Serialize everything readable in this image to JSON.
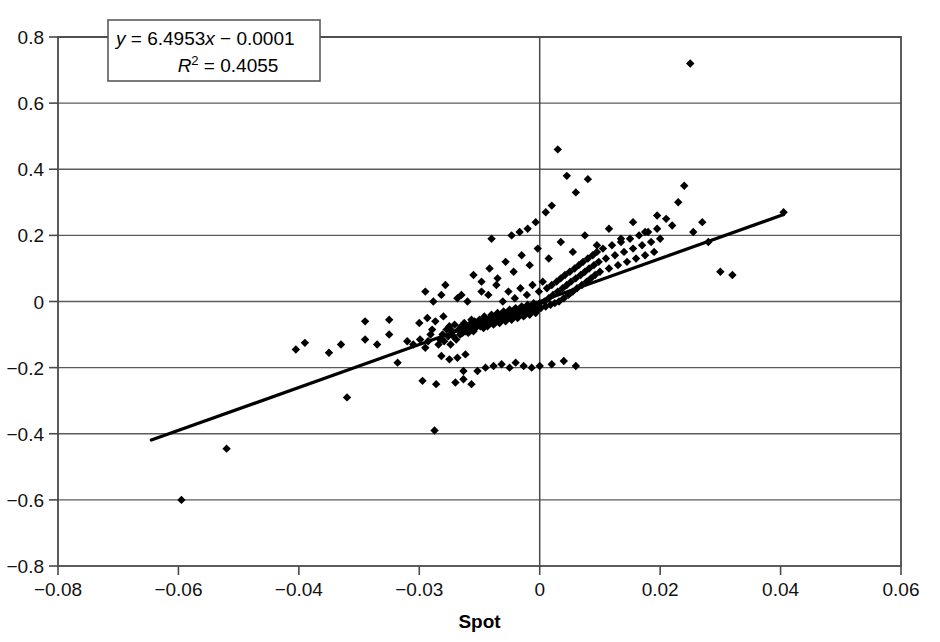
{
  "chart_data": {
    "type": "scatter",
    "title": "",
    "xlabel": "Spot",
    "ylabel": "",
    "xlim": [
      -0.08,
      0.06
    ],
    "ylim": [
      -0.8,
      0.8
    ],
    "grid": true,
    "legend": null,
    "xticks": [
      "-0.08",
      "-0.06",
      "-0.04",
      "-0.03",
      "0",
      "0.02",
      "0.04",
      "0.06"
    ],
    "yticks": [
      "0.8",
      "0.6",
      "0.4",
      "0.2",
      "0",
      "-0.2",
      "-0.4",
      "-0.6",
      "-0.8"
    ],
    "annotations": {
      "equation": "y = 6.4953x − 0.0001",
      "equation_y": "y",
      "equation_rest": " = 6.4953",
      "equation_x": "x",
      "equation_tail": " − 0.0001",
      "r_squared_symbol": "R",
      "r_squared_exponent": "2",
      "r_squared_value": " = 0.4055",
      "r_squared": "R2 = 0.4055"
    },
    "trendline": {
      "slope": 6.4953,
      "intercept": -0.0001,
      "r2": 0.4055,
      "x_start": -0.0645,
      "x_end": 0.0405
    },
    "series": [
      {
        "name": "Spot vs Return",
        "marker": "diamond",
        "color": "#000000",
        "points": [
          [
            -0.0595,
            -0.6
          ],
          [
            -0.052,
            -0.445
          ],
          [
            -0.0405,
            -0.145
          ],
          [
            -0.0395,
            -0.125
          ],
          [
            -0.0375,
            -0.155
          ],
          [
            -0.0365,
            -0.13
          ],
          [
            -0.036,
            -0.29
          ],
          [
            -0.0345,
            -0.115
          ],
          [
            -0.0335,
            -0.13
          ],
          [
            -0.0325,
            -0.1
          ],
          [
            -0.0318,
            -0.185
          ],
          [
            -0.031,
            -0.12
          ],
          [
            -0.0305,
            -0.13
          ],
          [
            -0.0298,
            -0.115
          ],
          [
            -0.0292,
            -0.24
          ],
          [
            -0.0285,
            -0.14
          ],
          [
            -0.0278,
            -0.12
          ],
          [
            -0.0272,
            -0.1
          ],
          [
            -0.0268,
            -0.085
          ],
          [
            -0.0262,
            -0.39
          ],
          [
            -0.0258,
            -0.25
          ],
          [
            -0.0252,
            -0.13
          ],
          [
            -0.0248,
            -0.115
          ],
          [
            -0.0245,
            0.02
          ],
          [
            -0.0242,
            -0.1
          ],
          [
            -0.0238,
            -0.12
          ],
          [
            -0.0232,
            -0.085
          ],
          [
            -0.0228,
            -0.105
          ],
          [
            -0.0225,
            -0.075
          ],
          [
            -0.0222,
            -0.13
          ],
          [
            -0.0218,
            -0.09
          ],
          [
            -0.0215,
            -0.105
          ],
          [
            -0.0212,
            -0.07
          ],
          [
            -0.0208,
            -0.115
          ],
          [
            -0.0205,
            0.01
          ],
          [
            -0.0202,
            -0.085
          ],
          [
            -0.0198,
            -0.1
          ],
          [
            -0.0195,
            -0.075
          ],
          [
            -0.0192,
            -0.095
          ],
          [
            -0.019,
            -0.21
          ],
          [
            -0.0188,
            -0.065
          ],
          [
            -0.0185,
            -0.09
          ],
          [
            -0.0182,
            -0.08
          ],
          [
            -0.018,
            0.0
          ],
          [
            -0.0178,
            -0.095
          ],
          [
            -0.0175,
            -0.07
          ],
          [
            -0.0172,
            -0.085
          ],
          [
            -0.017,
            -0.055
          ],
          [
            -0.0168,
            -0.075
          ],
          [
            -0.0165,
            -0.09
          ],
          [
            -0.0162,
            -0.06
          ],
          [
            -0.016,
            -0.08
          ],
          [
            -0.0158,
            -0.065
          ],
          [
            -0.0155,
            -0.21
          ],
          [
            -0.0152,
            -0.07
          ],
          [
            -0.015,
            -0.055
          ],
          [
            -0.0148,
            -0.075
          ],
          [
            -0.0145,
            0.03
          ],
          [
            -0.0142,
            -0.06
          ],
          [
            -0.014,
            -0.08
          ],
          [
            -0.0138,
            -0.045
          ],
          [
            -0.0135,
            -0.065
          ],
          [
            -0.0132,
            -0.055
          ],
          [
            -0.013,
            -0.075
          ],
          [
            -0.0128,
            0.02
          ],
          [
            -0.0125,
            -0.05
          ],
          [
            -0.0122,
            -0.065
          ],
          [
            -0.012,
            -0.04
          ],
          [
            -0.0118,
            -0.055
          ],
          [
            -0.0115,
            -0.07
          ],
          [
            -0.0112,
            -0.045
          ],
          [
            -0.011,
            -0.06
          ],
          [
            -0.0108,
            0.05
          ],
          [
            -0.0105,
            -0.035
          ],
          [
            -0.0102,
            -0.05
          ],
          [
            -0.01,
            -0.065
          ],
          [
            -0.0098,
            -0.04
          ],
          [
            -0.0095,
            -0.055
          ],
          [
            -0.0092,
            0.0
          ],
          [
            -0.009,
            -0.03
          ],
          [
            -0.0088,
            -0.045
          ],
          [
            -0.0085,
            -0.06
          ],
          [
            -0.0082,
            -0.035
          ],
          [
            -0.008,
            -0.05
          ],
          [
            -0.0078,
            0.03
          ],
          [
            -0.0075,
            -0.025
          ],
          [
            -0.0072,
            -0.04
          ],
          [
            -0.007,
            -0.055
          ],
          [
            -0.0068,
            -0.03
          ],
          [
            -0.0065,
            -0.045
          ],
          [
            -0.0062,
            0.01
          ],
          [
            -0.006,
            -0.02
          ],
          [
            -0.0058,
            -0.035
          ],
          [
            -0.0055,
            -0.05
          ],
          [
            -0.0052,
            -0.025
          ],
          [
            -0.005,
            -0.04
          ],
          [
            -0.0048,
            0.04
          ],
          [
            -0.0045,
            -0.015
          ],
          [
            -0.0042,
            -0.03
          ],
          [
            -0.004,
            -0.045
          ],
          [
            -0.0038,
            -0.02
          ],
          [
            -0.0035,
            -0.035
          ],
          [
            -0.0032,
            0.02
          ],
          [
            -0.003,
            -0.01
          ],
          [
            -0.0028,
            -0.025
          ],
          [
            -0.0025,
            -0.04
          ],
          [
            -0.0022,
            -0.015
          ],
          [
            -0.002,
            -0.03
          ],
          [
            -0.0018,
            0.05
          ],
          [
            -0.0015,
            -0.005
          ],
          [
            -0.0012,
            -0.02
          ],
          [
            -0.001,
            -0.035
          ],
          [
            -0.0008,
            -0.01
          ],
          [
            -0.0005,
            -0.025
          ],
          [
            -0.0002,
            0.03
          ],
          [
            0.0,
            -0.005
          ],
          [
            0.0002,
            -0.02
          ],
          [
            0.0005,
            0.06
          ],
          [
            0.0008,
            0.0
          ],
          [
            0.001,
            -0.015
          ],
          [
            0.0012,
            0.04
          ],
          [
            0.0015,
            0.01
          ],
          [
            0.0018,
            -0.01
          ],
          [
            0.002,
            0.05
          ],
          [
            0.0022,
            0.02
          ],
          [
            0.0025,
            -0.005
          ],
          [
            0.0028,
            0.06
          ],
          [
            0.003,
            0.03
          ],
          [
            0.0032,
            0.0
          ],
          [
            0.0035,
            0.07
          ],
          [
            0.0038,
            0.04
          ],
          [
            0.004,
            0.01
          ],
          [
            0.0042,
            0.08
          ],
          [
            0.0045,
            0.05
          ],
          [
            0.0048,
            0.02
          ],
          [
            0.005,
            0.09
          ],
          [
            0.0052,
            0.06
          ],
          [
            0.0055,
            0.03
          ],
          [
            0.0058,
            0.1
          ],
          [
            0.006,
            0.07
          ],
          [
            0.0062,
            0.04
          ],
          [
            0.0065,
            0.11
          ],
          [
            0.0068,
            0.08
          ],
          [
            0.007,
            0.05
          ],
          [
            0.0072,
            0.12
          ],
          [
            0.0075,
            0.09
          ],
          [
            0.0078,
            0.06
          ],
          [
            0.008,
            0.13
          ],
          [
            0.0082,
            0.1
          ],
          [
            0.0085,
            0.07
          ],
          [
            0.0088,
            0.14
          ],
          [
            0.009,
            0.11
          ],
          [
            0.0092,
            0.08
          ],
          [
            0.0095,
            0.15
          ],
          [
            0.0098,
            0.12
          ],
          [
            0.01,
            0.09
          ],
          [
            0.0105,
            0.16
          ],
          [
            0.011,
            0.13
          ],
          [
            0.0115,
            0.1
          ],
          [
            0.012,
            0.17
          ],
          [
            0.0125,
            0.14
          ],
          [
            0.013,
            0.11
          ],
          [
            0.0135,
            0.18
          ],
          [
            0.014,
            0.15
          ],
          [
            0.0145,
            0.12
          ],
          [
            0.015,
            0.19
          ],
          [
            0.0155,
            0.16
          ],
          [
            0.016,
            0.13
          ],
          [
            0.0165,
            0.2
          ],
          [
            0.017,
            0.17
          ],
          [
            0.0175,
            0.14
          ],
          [
            0.018,
            0.21
          ],
          [
            0.0185,
            0.18
          ],
          [
            0.019,
            0.15
          ],
          [
            0.0195,
            0.22
          ],
          [
            0.02,
            0.19
          ],
          [
            0.021,
            0.25
          ],
          [
            0.022,
            0.23
          ],
          [
            0.023,
            0.3
          ],
          [
            0.024,
            0.35
          ],
          [
            0.025,
            0.72
          ],
          [
            0.0255,
            0.21
          ],
          [
            0.027,
            0.24
          ],
          [
            0.028,
            0.18
          ],
          [
            0.03,
            0.09
          ],
          [
            0.032,
            0.08
          ],
          [
            0.0405,
            0.27
          ],
          [
            -0.0285,
            0.03
          ],
          [
            -0.0265,
            0.0
          ],
          [
            -0.0235,
            0.05
          ],
          [
            -0.0195,
            0.02
          ],
          [
            -0.0165,
            0.08
          ],
          [
            -0.0145,
            0.06
          ],
          [
            -0.0125,
            0.1
          ],
          [
            -0.0105,
            0.07
          ],
          [
            -0.0085,
            0.12
          ],
          [
            -0.0065,
            0.09
          ],
          [
            -0.0045,
            0.14
          ],
          [
            -0.0025,
            0.11
          ],
          [
            -0.0005,
            0.16
          ],
          [
            0.0015,
            0.13
          ],
          [
            0.0035,
            0.18
          ],
          [
            0.0055,
            0.15
          ],
          [
            0.0075,
            0.2
          ],
          [
            0.0095,
            0.17
          ],
          [
            0.0115,
            0.22
          ],
          [
            0.0135,
            0.19
          ],
          [
            0.0155,
            0.24
          ],
          [
            0.0175,
            0.21
          ],
          [
            0.0195,
            0.26
          ],
          [
            0.003,
            0.46
          ],
          [
            0.0045,
            0.38
          ],
          [
            0.006,
            0.33
          ],
          [
            0.008,
            0.37
          ],
          [
            0.002,
            0.29
          ],
          [
            0.001,
            0.27
          ],
          [
            -0.001,
            0.24
          ],
          [
            -0.003,
            0.22
          ],
          [
            -0.005,
            0.21
          ],
          [
            -0.007,
            0.2
          ],
          [
            -0.012,
            0.19
          ],
          [
            -0.0135,
            -0.2
          ],
          [
            -0.0115,
            -0.195
          ],
          [
            -0.0095,
            -0.19
          ],
          [
            -0.0075,
            -0.2
          ],
          [
            -0.006,
            -0.185
          ],
          [
            -0.004,
            -0.195
          ],
          [
            -0.002,
            -0.2
          ],
          [
            0.0,
            -0.195
          ],
          [
            0.002,
            -0.19
          ],
          [
            0.004,
            -0.18
          ],
          [
            0.006,
            -0.195
          ],
          [
            -0.021,
            -0.245
          ],
          [
            -0.019,
            -0.235
          ],
          [
            -0.017,
            -0.25
          ],
          [
            -0.0245,
            -0.165
          ],
          [
            -0.0225,
            -0.175
          ],
          [
            -0.0205,
            -0.17
          ],
          [
            -0.0185,
            -0.16
          ],
          [
            -0.0345,
            -0.06
          ],
          [
            -0.0325,
            -0.055
          ],
          [
            -0.03,
            -0.065
          ],
          [
            -0.028,
            -0.05
          ],
          [
            -0.026,
            -0.06
          ],
          [
            -0.024,
            -0.045
          ]
        ]
      }
    ]
  }
}
